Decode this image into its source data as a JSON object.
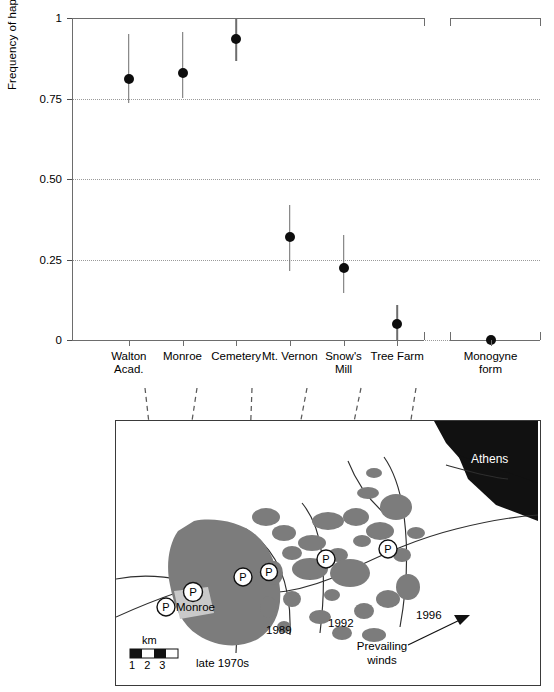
{
  "chart_data": {
    "type": "scatter",
    "title": "",
    "xlabel": "",
    "ylabel": "Frequency of haplotype C",
    "ylim": [
      0,
      1
    ],
    "yticks": [
      "0",
      "0.25",
      "0.50",
      "0.75",
      "1"
    ],
    "ytick_values": [
      0,
      0.25,
      0.5,
      0.75,
      1
    ],
    "grid": "horizontal-dotted",
    "legend": "none",
    "error_bars": "95% confidence interval",
    "categories": [
      "Walton Acad.",
      "Monroe",
      "Cemetery",
      "Mt. Vernon",
      "Snow's Mill",
      "Tree Farm",
      "Monogyne form"
    ],
    "category_lines": [
      [
        "Walton",
        "Acad."
      ],
      [
        "Monroe"
      ],
      [
        "Cemetery"
      ],
      [
        "Mt. Vernon"
      ],
      [
        "Snow's",
        "Mill"
      ],
      [
        "Tree Farm"
      ],
      [
        "Monogyne",
        "form"
      ]
    ],
    "values": [
      0.81,
      0.83,
      0.935,
      0.32,
      0.225,
      0.05,
      0.0
    ],
    "err_low": [
      0.735,
      0.75,
      0.865,
      0.215,
      0.145,
      0.0,
      0.0
    ],
    "err_high": [
      0.95,
      0.955,
      1.0,
      0.42,
      0.325,
      0.11,
      0.0
    ],
    "group_break_after_index": 5
  },
  "chart": {
    "ylabel": "Frequency of haplotype C",
    "yticks": [
      "1",
      "0.75",
      "0.50",
      "0.25",
      "0"
    ]
  },
  "map": {
    "labels": {
      "athens": "Athens",
      "monroe": "Monroe",
      "late_1970s": "late 1970s",
      "y1989": "1989",
      "y1992": "1992",
      "y1996": "1996",
      "prevailing_winds_line1": "Prevailing",
      "prevailing_winds_line2": "winds",
      "scale_unit": "km",
      "scale_ticks": "1 2 3",
      "site_marker": "P"
    },
    "colors": {
      "infestation": "#7c7c7c",
      "monroe_town": "#c9c9c9",
      "athens_city": "#111111",
      "border": "#3a3a3a"
    }
  }
}
